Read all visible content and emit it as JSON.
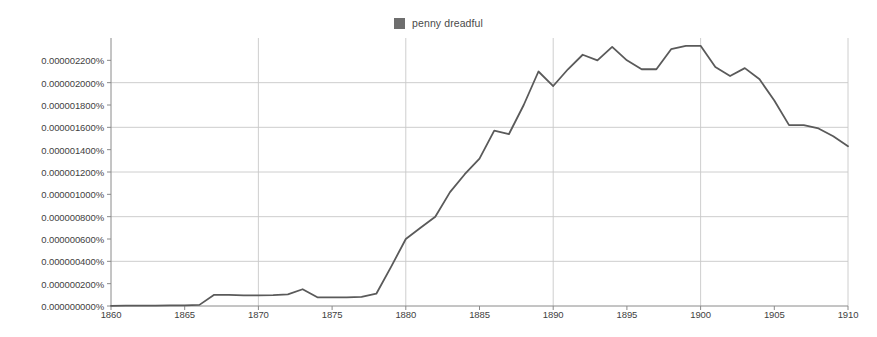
{
  "chart_data": {
    "type": "line",
    "title": "",
    "subtitle": "",
    "xlabel": "",
    "ylabel": "",
    "grid": true,
    "legend_position": "top-center",
    "series": [
      {
        "name": "penny dreadful",
        "color": "#5a5a5a",
        "x": [
          1860,
          1861,
          1862,
          1863,
          1864,
          1865,
          1866,
          1867,
          1868,
          1869,
          1870,
          1871,
          1872,
          1873,
          1874,
          1875,
          1876,
          1877,
          1878,
          1879,
          1880,
          1881,
          1882,
          1883,
          1884,
          1885,
          1886,
          1887,
          1888,
          1889,
          1890,
          1891,
          1892,
          1893,
          1894,
          1895,
          1896,
          1897,
          1898,
          1899,
          1900,
          1901,
          1902,
          1903,
          1904,
          1905,
          1906,
          1907,
          1908,
          1909,
          1910
        ],
        "values": [
          2e-09,
          3e-09,
          4e-09,
          4e-09,
          5e-09,
          6e-09,
          1e-08,
          1e-07,
          1e-07,
          9.6e-08,
          9.6e-08,
          9.8e-08,
          1.04e-07,
          1.5e-07,
          7.8e-08,
          7.8e-08,
          7.8e-08,
          8.2e-08,
          1.1e-07,
          3.5e-07,
          6e-07,
          7e-07,
          8e-07,
          1.02e-06,
          1.18e-06,
          1.32e-06,
          1.57e-06,
          1.54e-06,
          1.8e-06,
          2.1e-06,
          1.97e-06,
          2.12e-06,
          2.25e-06,
          2.2e-06,
          2.32e-06,
          2.2e-06,
          2.12e-06,
          2.12e-06,
          2.3e-06,
          2.33e-06,
          2.33e-06,
          2.14e-06,
          2.06e-06,
          2.13e-06,
          2.03e-06,
          1.84e-06,
          1.62e-06,
          1.62e-06,
          1.59e-06,
          1.52e-06,
          1.43e-06
        ]
      }
    ],
    "xlim": [
      1860,
      1910
    ],
    "ylim": [
      0.0,
      2.4e-06
    ],
    "x_ticks": [
      1860,
      1865,
      1870,
      1875,
      1880,
      1885,
      1890,
      1895,
      1900,
      1905,
      1910
    ],
    "x_tick_labels": [
      "1860",
      "1865",
      "1870",
      "1875",
      "1880",
      "1885",
      "1890",
      "1895",
      "1900",
      "1905",
      "1910"
    ],
    "x_gridlines": [
      1870,
      1880,
      1890,
      1900,
      1910
    ],
    "y_ticks": [
      0.0,
      2e-07,
      4e-07,
      6e-07,
      8e-07,
      1e-06,
      1.2e-06,
      1.4e-06,
      1.6e-06,
      1.8e-06,
      2e-06,
      2.2e-06
    ],
    "y_tick_labels": [
      "0.000000000%",
      "0.000000200%",
      "0.000000400%",
      "0.000000600%",
      "0.000000800%",
      "0.000001000%",
      "0.000001200%",
      "0.000001400%",
      "0.000001600%",
      "0.000001800%",
      "0.000002000%",
      "0.000002200%"
    ],
    "y_gridlines": [
      4e-07,
      8e-07,
      1.2e-06,
      1.6e-06,
      2e-06
    ],
    "colors": {
      "line": "#5a5a5a",
      "legend_swatch": "#6e6e6e",
      "grid": "#c8c8c8",
      "axis": "#8a8a8a",
      "text": "#3f3f3f",
      "background": "#ffffff"
    }
  },
  "legend": {
    "entries": [
      {
        "label": "penny dreadful",
        "swatch_color": "#6e6e6e"
      }
    ]
  }
}
